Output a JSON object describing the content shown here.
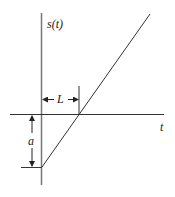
{
  "diagram": {
    "y_axis_label": "s(t)",
    "x_axis_label": "t",
    "delay_label": "L",
    "offset_label": "a",
    "colors": {
      "line": "#222222",
      "axis": "#666666",
      "background": "#ffffff"
    }
  }
}
